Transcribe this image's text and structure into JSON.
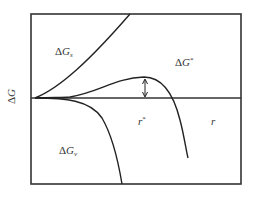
{
  "figure": {
    "type": "free-energy-vs-radius-diagram",
    "y_axis_label_delta": "Δ",
    "y_axis_label_var": "G",
    "x_axis_label": "r",
    "curve_labels": {
      "surface": {
        "delta": "Δ",
        "var": "G",
        "sub": "s"
      },
      "volume": {
        "delta": "Δ",
        "var": "G",
        "sub": "v"
      },
      "total": {
        "delta": "Δ",
        "var": "G",
        "sup": "*"
      }
    },
    "critical_radius": {
      "var": "r",
      "sup": "*"
    },
    "colors": {
      "line": "#222222",
      "frame": "#333333",
      "text": "#333333",
      "background": "#ffffff"
    }
  }
}
